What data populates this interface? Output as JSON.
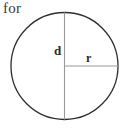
{
  "figure": {
    "caption": "for",
    "background_color": "#ffffff",
    "circle": {
      "name": "circle-outline",
      "center_x": 64.5,
      "center_y": 66,
      "radius": 53.5,
      "stroke_color": "#2e2e2e",
      "stroke_width": 1.3,
      "fill": "none"
    },
    "diameter_line": {
      "name": "diameter-line",
      "label": "d",
      "x1": 64.5,
      "y1": 12.5,
      "x2": 64.5,
      "y2": 119.5,
      "stroke_color": "#9a9a9a",
      "stroke_width": 1.1
    },
    "radius_line": {
      "name": "radius-line",
      "label": "r",
      "x1": 64.5,
      "y1": 66,
      "x2": 118,
      "y2": 66,
      "stroke_color": "#9a9a9a",
      "stroke_width": 1.1
    },
    "labels": {
      "diameter": "d",
      "radius": "r"
    }
  }
}
